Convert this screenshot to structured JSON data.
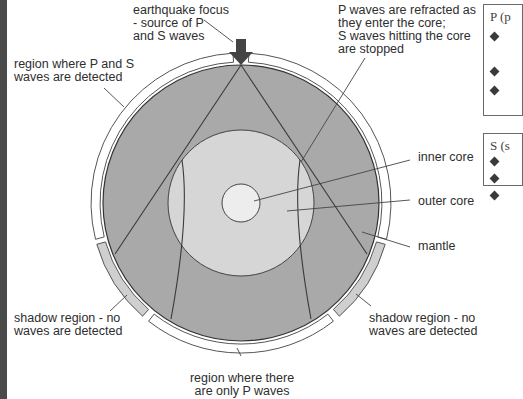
{
  "diagram": {
    "colors": {
      "mantle": "#a9a9a9",
      "outer_core": "#d4d4d4",
      "inner_core": "#ececec",
      "shadow_region": "#cfcfcf",
      "line": "#3a3a3a",
      "left_bar": "#4a4a4a"
    },
    "labels": {
      "focus": "earthquake focus\n- source of P\nand S waves",
      "p_and_s_region": "region where P and S\nwaves are detected",
      "refraction": "P waves are refracted as\nthey enter the core;\nS waves hitting the core\nare stopped",
      "inner_core": "inner core",
      "outer_core": "outer core",
      "mantle": "mantle",
      "shadow_left": "shadow region - no\nwaves are detected",
      "shadow_right": "shadow region - no\nwaves are detected",
      "p_only_region": "region where there\nare only P waves"
    },
    "icons": {
      "focus_marker": "down-arrow-icon"
    }
  },
  "side_panels": [
    {
      "title": "P (p",
      "bullet_count": 3
    },
    {
      "title": "S (s",
      "bullet_count": 3
    }
  ]
}
